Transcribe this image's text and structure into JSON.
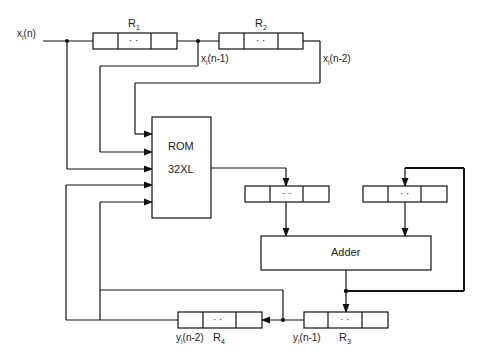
{
  "diagram": {
    "input_label": "x",
    "input_sub": "i",
    "input_arg": "(n)",
    "registers": {
      "r1": {
        "name": "R",
        "sub": "1",
        "dots": "· ·"
      },
      "r2": {
        "name": "R",
        "sub": "2",
        "dots": "· ·"
      },
      "r3": {
        "name": "R",
        "sub": "3",
        "dots": "· ·"
      },
      "r4": {
        "name": "R",
        "sub": "4",
        "dots": "· ·"
      },
      "buf_left": {
        "dots": "· ·"
      },
      "buf_right": {
        "dots": "· ·"
      }
    },
    "signals": {
      "x_n1": {
        "v": "x",
        "sub": "i",
        "arg": "(n-1)"
      },
      "x_n2": {
        "v": "x",
        "sub": "i",
        "arg": "(n-2)"
      },
      "y_n1": {
        "v": "y",
        "sub": "i",
        "arg": "(n-1)"
      },
      "y_n2": {
        "v": "y",
        "sub": "i",
        "arg": "(n-2)"
      }
    },
    "rom": {
      "line1": "ROM",
      "line2": "32XL"
    },
    "adder": {
      "label": "Adder"
    }
  }
}
